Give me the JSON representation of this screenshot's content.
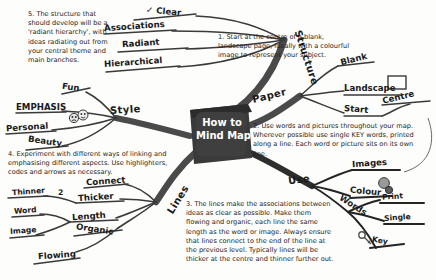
{
  "title": "How to Mind Map",
  "centre": {
    "line1": "How to",
    "line2": "Mind Map",
    "fill": "#3a3a3a"
  },
  "colors": {
    "ink": "#1a1a1a",
    "branch": "#555555",
    "paper": "#fdfdfc",
    "note": "#242424"
  },
  "notes": [
    {
      "id": "note1",
      "text": "1. Start at the centre of a blank, landscape page, ideally with a colourful image to represent your subject."
    },
    {
      "id": "note2",
      "text": "2. Use words and pictures throughout your map. Wherever possible use single KEY words, printed along a line. Each word or picture sits on its own line."
    },
    {
      "id": "note3",
      "text": "3. The lines make the associations between ideas as clear as possible. Make them flowing and organic, each line the same length as the word or image. Always ensure that lines connect to the end of the line at the previous level. Typically lines will be thicker at the centre and thinner further out."
    },
    {
      "id": "note4",
      "text": "4. Experiment with different ways of linking and emphasising different aspects. Use highlighters, codes and arrows as necessary."
    },
    {
      "id": "note5",
      "text": "5. The structure that should develop will be a 'radiant hierarchy', with ideas radiating out from your central theme and main branches."
    }
  ],
  "branches": [
    {
      "id": "structure",
      "label": "Structure",
      "children": [
        {
          "label": "Clear",
          "mark": "✓"
        },
        {
          "label": "Associations"
        },
        {
          "label": "Radiant"
        },
        {
          "label": "Hierarchical"
        }
      ]
    },
    {
      "id": "paper",
      "label": "Paper",
      "children": [
        {
          "label": "Blank"
        },
        {
          "label": "Landscape",
          "icon": "page-rectangle-icon"
        },
        {
          "label": "Start",
          "children": [
            {
              "label": "Centre"
            }
          ]
        }
      ]
    },
    {
      "id": "use",
      "label": "Use",
      "children": [
        {
          "label": "Images"
        },
        {
          "label": "Colour",
          "icon": "palette-icon"
        },
        {
          "label": "Words",
          "children": [
            {
              "label": "Print"
            },
            {
              "label": "Single"
            },
            {
              "label": "Key",
              "icon": "key-icon"
            }
          ]
        }
      ]
    },
    {
      "id": "lines",
      "label": "Lines",
      "children": [
        {
          "label": "Connect"
        },
        {
          "label": "Thicker",
          "children": [
            {
              "label": "Thinner"
            },
            {
              "label": "2"
            }
          ]
        },
        {
          "label": "Length",
          "children": [
            {
              "label": "Word"
            },
            {
              "label": "Image"
            }
          ]
        },
        {
          "label": "Organic"
        },
        {
          "label": "Flowing"
        }
      ]
    },
    {
      "id": "style",
      "label": "Style",
      "children": [
        {
          "label": "Fun"
        },
        {
          "label": "EMPHASIS",
          "icon": "faces-icon"
        },
        {
          "label": "Personal"
        },
        {
          "label": "Beauty"
        }
      ]
    }
  ]
}
